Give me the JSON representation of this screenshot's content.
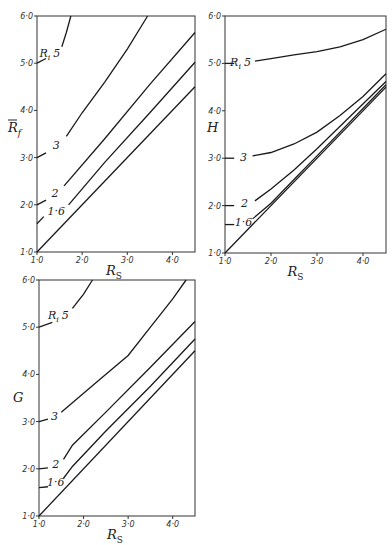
{
  "chart_data": [
    {
      "type": "line",
      "panel": "top-left",
      "title": "",
      "xlabel": "R_S",
      "ylabel": "R̄_f",
      "xlim": [
        1.0,
        4.5
      ],
      "ylim": [
        1.0,
        6.0
      ],
      "xticks": [
        "1·0",
        "2·0",
        "3·0",
        "4·0"
      ],
      "yticks": [
        "1·0",
        "2·0",
        "3·0",
        "4·0",
        "5·0",
        "6·0"
      ],
      "grid": false,
      "legend": "inline labels (R_i)",
      "series": [
        {
          "name": "1",
          "label": "",
          "x": [
            1.0,
            4.5
          ],
          "y": [
            1.0,
            4.5
          ]
        },
        {
          "name": "1·6",
          "label": "1·6",
          "x": [
            1.0,
            1.15,
            1.7,
            2.5,
            3.5,
            4.5
          ],
          "y": [
            1.6,
            1.75,
            2.0,
            2.9,
            3.95,
            5.02
          ]
        },
        {
          "name": "2",
          "label": "2",
          "x": [
            1.0,
            1.2,
            1.6,
            2.5,
            3.5,
            4.5
          ],
          "y": [
            2.0,
            2.1,
            2.4,
            3.4,
            4.55,
            5.65
          ]
        },
        {
          "name": "3",
          "label": "3",
          "x": [
            1.0,
            1.2,
            1.65,
            2.0,
            2.5,
            3.0,
            3.45
          ],
          "y": [
            3.0,
            3.1,
            3.45,
            3.95,
            4.6,
            5.3,
            6.0
          ]
        },
        {
          "name": "5",
          "label": "R_i 5",
          "x": [
            1.0,
            1.2,
            1.55,
            1.65,
            1.75
          ],
          "y": [
            5.0,
            5.1,
            5.35,
            5.65,
            6.0
          ]
        }
      ]
    },
    {
      "type": "line",
      "panel": "top-right",
      "title": "",
      "xlabel": "R_S",
      "ylabel": "H",
      "xlim": [
        1.0,
        4.5
      ],
      "ylim": [
        1.0,
        6.0
      ],
      "xticks": [
        "1·0",
        "2·0",
        "3·0",
        "4·0"
      ],
      "yticks": [
        "1·0",
        "2·0",
        "3·0",
        "4·0",
        "5·0",
        "6·0"
      ],
      "grid": false,
      "legend": "inline labels (R_i)",
      "series": [
        {
          "name": "1",
          "label": "",
          "x": [
            1.0,
            4.5
          ],
          "y": [
            1.0,
            4.5
          ]
        },
        {
          "name": "1·6",
          "label": "1·6",
          "x": [
            1.0,
            1.2,
            1.6,
            2.0,
            2.5,
            3.0,
            4.5
          ],
          "y": [
            1.6,
            1.6,
            1.72,
            2.05,
            2.55,
            3.05,
            4.55
          ]
        },
        {
          "name": "2",
          "label": "2",
          "x": [
            1.0,
            1.2,
            1.65,
            2.0,
            2.5,
            3.0,
            4.5
          ],
          "y": [
            2.0,
            2.0,
            2.1,
            2.35,
            2.75,
            3.2,
            4.62
          ]
        },
        {
          "name": "3",
          "label": "3",
          "x": [
            1.0,
            1.2,
            1.6,
            2.0,
            2.5,
            3.0,
            3.5,
            4.0,
            4.5
          ],
          "y": [
            3.0,
            3.0,
            3.05,
            3.12,
            3.3,
            3.55,
            3.9,
            4.3,
            4.78
          ]
        },
        {
          "name": "5",
          "label": "R_i 5",
          "x": [
            1.0,
            1.2,
            1.65,
            2.0,
            2.5,
            3.0,
            3.5,
            4.0,
            4.5
          ],
          "y": [
            5.0,
            5.0,
            5.05,
            5.1,
            5.18,
            5.25,
            5.35,
            5.5,
            5.72
          ]
        }
      ]
    },
    {
      "type": "line",
      "panel": "bottom-left",
      "title": "",
      "xlabel": "R_S",
      "ylabel": "G",
      "xlim": [
        1.0,
        4.5
      ],
      "ylim": [
        1.0,
        6.0
      ],
      "xticks": [
        "1·0",
        "2·0",
        "3·0",
        "4·0"
      ],
      "yticks": [
        "1·0",
        "2·0",
        "3·0",
        "4·0",
        "5·0",
        "6·0"
      ],
      "grid": false,
      "legend": "inline labels (R_i)",
      "series": [
        {
          "name": "1",
          "label": "",
          "x": [
            1.0,
            4.5
          ],
          "y": [
            1.0,
            4.5
          ]
        },
        {
          "name": "1·6",
          "label": "1·6",
          "x": [
            1.0,
            1.2,
            1.55,
            1.75,
            2.5,
            3.5,
            4.5
          ],
          "y": [
            1.6,
            1.62,
            1.8,
            2.05,
            2.8,
            3.75,
            4.75
          ]
        },
        {
          "name": "2",
          "label": "2",
          "x": [
            1.0,
            1.2,
            1.55,
            1.75,
            2.5,
            3.5,
            4.5
          ],
          "y": [
            2.0,
            2.02,
            2.2,
            2.5,
            3.2,
            4.15,
            5.12
          ]
        },
        {
          "name": "3",
          "label": "3",
          "x": [
            1.0,
            1.2,
            1.5,
            1.75,
            2.25,
            3.0,
            3.5,
            4.0,
            4.3
          ],
          "y": [
            3.0,
            3.05,
            3.2,
            3.4,
            3.8,
            4.4,
            5.0,
            5.6,
            6.0
          ]
        },
        {
          "name": "5",
          "label": "R_i 5",
          "x": [
            1.0,
            1.3,
            1.75,
            2.0,
            2.2
          ],
          "y": [
            5.0,
            5.1,
            5.4,
            5.7,
            6.0
          ]
        }
      ]
    }
  ],
  "labels": {
    "panel1_ylabel_main": "R",
    "panel1_ylabel_sub": "f",
    "panel2_ylabel": "H",
    "panel3_ylabel": "G",
    "xlabel_main": "R",
    "xlabel_sub": "S",
    "ri_main": "R",
    "ri_sub": "i",
    "ri_value": "5",
    "c3": "3",
    "c2": "2",
    "c16": "1·6",
    "xt1": "1·0",
    "xt2": "2·0",
    "xt3": "3·0",
    "xt4": "4·0",
    "yt1": "1·0",
    "yt2": "2·0",
    "yt3": "3·0",
    "yt4": "4·0",
    "yt5": "5·0",
    "yt6": "6·0",
    "yt6_p3": "6 0",
    "yt2_p2": "2 0"
  }
}
